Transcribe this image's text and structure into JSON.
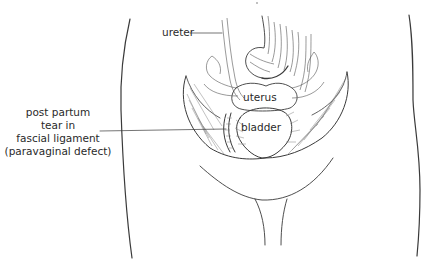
{
  "figure": {
    "labels": {
      "ureter": "ureter",
      "uterus": "uterus",
      "bladder": "bladder",
      "defect": {
        "lines": [
          "post partum",
          "tear in",
          "fascial ligament",
          "(paravaginal defect)"
        ]
      }
    },
    "colors": {
      "ink": "#3a3a3a",
      "text": "#2a2a2a",
      "organ_fill": "#ffffff",
      "background": "#ffffff"
    }
  }
}
